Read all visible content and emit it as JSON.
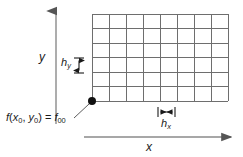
{
  "figure": {
    "type": "grid-mesh-diagram",
    "background_color": "#ffffff",
    "ink_color": "#1a1a1a",
    "grid_line_color": "#6e6e6e",
    "axis_color": "#8a8a8a"
  },
  "axes": {
    "y": {
      "label": "y",
      "orientation": "vertical",
      "arrow": "up",
      "x": 56,
      "y_top": 9,
      "y_bottom": 124
    },
    "x": {
      "label": "x",
      "orientation": "horizontal",
      "arrow": "right",
      "y": 137,
      "x_left": 84,
      "x_right": 233
    }
  },
  "grid": {
    "columns": 8,
    "rows": 6,
    "left": 92,
    "right": 228,
    "top": 14,
    "bottom": 101
  },
  "origin_point": {
    "label_main": "f",
    "label_full": "f(x0, y0) = f00",
    "open_paren": "(",
    "var_x": "x",
    "sub_x": "0",
    "comma": ", ",
    "var_y": "y",
    "sub_y": "0",
    "close_paren": ")",
    "equals": " = ",
    "result_var": "f",
    "result_sub": "00",
    "dot_x": 92,
    "dot_y": 101,
    "dot_radius": 4
  },
  "spacing_markers": {
    "hy": {
      "symbol": "h",
      "subscript": "y",
      "orientation": "vertical",
      "arrow_x": 79,
      "arrow_top": 58,
      "arrow_bottom": 73,
      "cap_half_width": 5
    },
    "hx": {
      "symbol": "h",
      "subscript": "x",
      "orientation": "horizontal",
      "arrow_y": 112,
      "arrow_left": 158,
      "arrow_right": 175,
      "cap_half_height": 5
    }
  },
  "leader_line": {
    "from_x": 74,
    "from_y": 118,
    "to_x": 89,
    "to_y": 104
  }
}
